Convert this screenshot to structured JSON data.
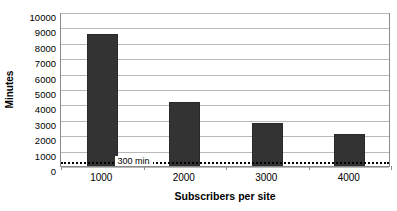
{
  "chart_data": {
    "type": "bar",
    "title": "",
    "categories": [
      "1000",
      "2000",
      "3000",
      "4000"
    ],
    "values": [
      8600,
      4150,
      2800,
      2100
    ],
    "series": [
      {
        "name": "Minutes",
        "values": [
          8600,
          4150,
          2800,
          2100
        ]
      }
    ],
    "xlabel": "Subscribers per site",
    "ylabel": "Minutes",
    "ylim": [
      0,
      10000
    ],
    "ytick_labels": [
      "10000",
      "9000",
      "8000",
      "7000",
      "6000",
      "5000",
      "4000",
      "3000",
      "2000",
      "1000",
      "0"
    ],
    "ytick_values": [
      10000,
      9000,
      8000,
      7000,
      6000,
      5000,
      4000,
      3000,
      2000,
      1000,
      0
    ],
    "ytick_step": 1000,
    "grid": true,
    "grid_axis": "y",
    "legend": false,
    "legend_position": "none",
    "bar_color": "#333333",
    "grid_color": "#b9b9b9",
    "axis_color": "#8a8a8a",
    "background_color": "#ffffff",
    "annotations": [
      {
        "name": "threshold",
        "label": "300 min",
        "value": 300,
        "orientation": "horizontal",
        "style": "dotted",
        "color": "#000000"
      }
    ]
  }
}
